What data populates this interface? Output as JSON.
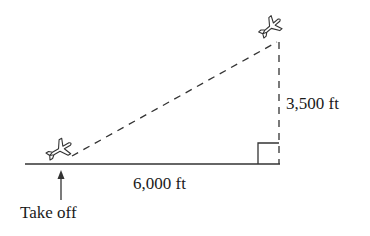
{
  "diagram": {
    "type": "right-triangle-word-problem",
    "labels": {
      "horizontal_distance": "6,000 ft",
      "altitude": "3,500 ft",
      "takeoff": "Take off"
    },
    "elements": {
      "ground_line": "solid",
      "flight_path": "dashed hypotenuse",
      "altitude_line": "dashed vertical",
      "right_angle_marker": true,
      "takeoff_arrow": "arrow pointing up to takeoff point"
    },
    "icons": [
      "airplane-icon-takeoff",
      "airplane-icon-altitude"
    ],
    "colors": {
      "stroke": "#333333",
      "text": "#1a1a1a",
      "background": "#ffffff"
    }
  }
}
